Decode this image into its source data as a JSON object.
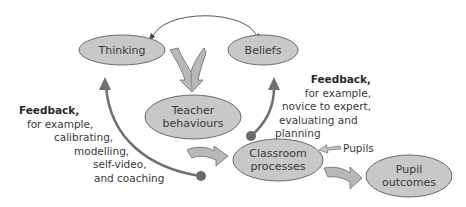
{
  "diagram": {
    "colors": {
      "node_fill": "#c8c8c8",
      "node_stroke": "#6a6a6a",
      "arrow_fill": "#b8b8b8",
      "feedback_arrow": "#707070",
      "text": "#3a3a3a"
    },
    "nodes": {
      "thinking": {
        "label": "Thinking"
      },
      "beliefs": {
        "label": "Beliefs"
      },
      "teacher": {
        "line1": "Teacher",
        "line2": "behaviours"
      },
      "classroom": {
        "line1": "Classroom",
        "line2": "processes"
      },
      "pupil": {
        "line1": "Pupil",
        "line2": "outcomes"
      }
    },
    "feedback_left": {
      "title": "Feedback,",
      "lines": [
        "for example,",
        "calibrating,",
        "modelling,",
        "self-video,",
        "and coaching"
      ]
    },
    "feedback_right": {
      "title": "Feedback,",
      "lines": [
        "for example,",
        "novice to expert,",
        "evaluating and",
        "planning"
      ]
    },
    "pupils_input": {
      "label": "Pupils"
    },
    "edges": [
      {
        "from": "Thinking",
        "to": "Beliefs",
        "type": "bidirectional-arc"
      },
      {
        "from": "Thinking+Beliefs",
        "to": "Teacher behaviours",
        "type": "merge-block-arrow"
      },
      {
        "from": "Teacher behaviours",
        "to": "Classroom processes",
        "type": "block-arrow"
      },
      {
        "from": "Classroom processes",
        "to": "Pupil outcomes",
        "type": "block-arrow"
      },
      {
        "from": "Pupils",
        "to": "Classroom processes",
        "type": "small-arrow"
      },
      {
        "from": "Classroom processes",
        "to": "Thinking",
        "type": "feedback-curve"
      },
      {
        "from": "Classroom processes",
        "to": "Beliefs",
        "type": "feedback-curve"
      }
    ]
  }
}
